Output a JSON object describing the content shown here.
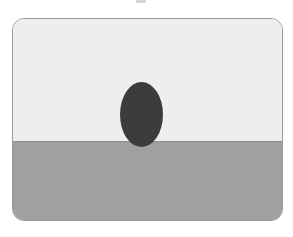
{
  "image": {
    "description": "Rounded rectangle card showing a dark oval resting on a horizon line between a light upper region and a gray lower region",
    "colors": {
      "upper_region": "#eeeeee",
      "lower_region": "#a0a0a0",
      "oval": "#3c3c3c",
      "border": "#9a9a9a"
    }
  }
}
